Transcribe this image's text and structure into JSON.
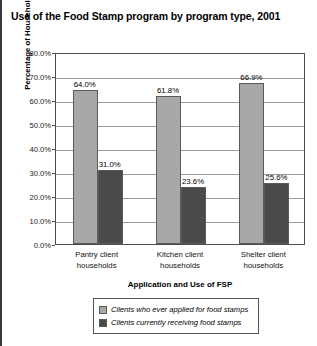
{
  "chart_data": {
    "type": "bar",
    "title": "Use of the Food Stamp program by program type, 2001",
    "xlabel": "Application and Use of FSP",
    "ylabel": "Percentage of Households",
    "categories": [
      "Pantry client households",
      "Kitchen client households",
      "Shelter client households"
    ],
    "series": [
      {
        "name": "Clients who ever applied for food stamps",
        "color": "#a8a8a8",
        "values": [
          64.0,
          61.8,
          66.9
        ],
        "labels": [
          "64.0%",
          "61.8%",
          "66.9%"
        ]
      },
      {
        "name": "Clients currently receiving food stamps",
        "color": "#4a4a4a",
        "values": [
          31.0,
          23.6,
          25.6
        ],
        "labels": [
          "31.0%",
          "23.6%",
          "25.6%"
        ]
      }
    ],
    "ylim": [
      0,
      80
    ],
    "ytick_values": [
      0,
      10,
      20,
      30,
      40,
      50,
      60,
      70,
      80
    ],
    "ytick_labels": [
      "0.0%",
      "10.0%",
      "20.0%",
      "30.0%",
      "40.0%",
      "50.0%",
      "60.0%",
      "70.0%",
      "80.0%"
    ],
    "grid": true,
    "legend_position": "bottom"
  }
}
